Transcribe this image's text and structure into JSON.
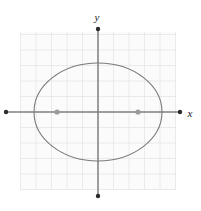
{
  "figure": {
    "title": "",
    "background_color": "#ffffff",
    "width": 201,
    "height": 211
  },
  "axes": {
    "x_label": "x",
    "y_label": "y",
    "axis_color": "#808080",
    "endpoint_marker": "dot",
    "origin_px": {
      "x": 98,
      "y": 112
    }
  },
  "grid": {
    "visible": true,
    "line_color": "#e8e8e8",
    "cell_size_px": 15.5,
    "left_px": 20,
    "top_px": 32,
    "right_px": 176,
    "bottom_px": 190
  },
  "chart_data": {
    "type": "scatter",
    "title": "",
    "xlabel": "x",
    "ylabel": "y",
    "grid": true,
    "legend": "none",
    "shapes": [
      {
        "kind": "ellipse",
        "name": "ellipse-curve",
        "center_px": {
          "x": 98,
          "y": 112
        },
        "radius_x_px": 64,
        "radius_y_px": 49,
        "stroke": "#7a7a7a",
        "stroke_width": 1.1,
        "fill": "none"
      }
    ],
    "points": [
      {
        "name": "left-focus",
        "px": {
          "x": 57,
          "y": 112
        },
        "marker": "dot",
        "color": "#9a9a9a",
        "radius_px": 2.6
      },
      {
        "name": "right-focus",
        "px": {
          "x": 138,
          "y": 112
        },
        "marker": "dot",
        "color": "#9a9a9a",
        "radius_px": 2.6
      }
    ],
    "axis_endpoints": [
      {
        "name": "x-axis-left-end",
        "px": {
          "x": 6,
          "y": 112
        }
      },
      {
        "name": "x-axis-right-end",
        "px": {
          "x": 180,
          "y": 112
        }
      },
      {
        "name": "y-axis-top-end",
        "px": {
          "x": 98,
          "y": 29
        }
      },
      {
        "name": "y-axis-bottom-end",
        "px": {
          "x": 98,
          "y": 196
        }
      }
    ]
  },
  "labels": {
    "y": {
      "text": "y",
      "px": {
        "x": 97,
        "y": 21
      }
    },
    "x": {
      "text": "x",
      "px": {
        "x": 190,
        "y": 117
      }
    }
  }
}
